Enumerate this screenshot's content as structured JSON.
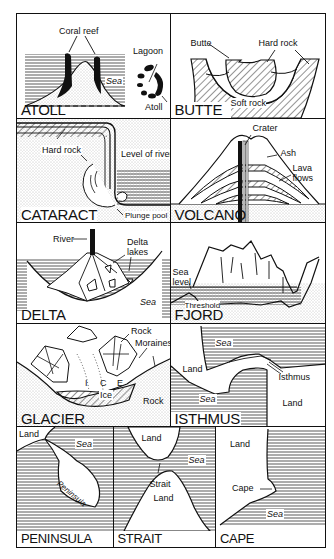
{
  "page_number": "",
  "panels": [
    {
      "id": "atoll",
      "title": "ATOLL",
      "labels": {
        "coral_reef": "Coral reef",
        "sea": "Sea",
        "lagoon": "Lagoon",
        "atoll": "Atoll"
      }
    },
    {
      "id": "butte",
      "title": "BUTTE",
      "labels": {
        "butte": "Butte",
        "hard_rock": "Hard rock",
        "soft_rock": "Soft rock"
      }
    },
    {
      "id": "cataract",
      "title": "CATARACT",
      "labels": {
        "hard_rock": "Hard rock",
        "level_of_river": "Level of river",
        "plunge_pool": "Plunge pool"
      }
    },
    {
      "id": "volcano",
      "title": "VOLCANO",
      "labels": {
        "crater": "Crater",
        "ash": "Ash",
        "lava": "Lava",
        "flows": "flows"
      }
    },
    {
      "id": "delta",
      "title": "DELTA",
      "labels": {
        "river": "River",
        "delta": "Delta",
        "lakes": "lakes",
        "sea": "Sea"
      }
    },
    {
      "id": "fjord",
      "title": "FJORD",
      "labels": {
        "sea": "Sea",
        "level": "level",
        "threshold": "Threshold"
      }
    },
    {
      "id": "glacier",
      "title": "GLACIER",
      "labels": {
        "rock_top": "Rock",
        "moraines": "Moraines",
        "i": "I",
        "c": "C",
        "e": "E",
        "ice": "Ice",
        "rock_bottom": "Rock"
      }
    },
    {
      "id": "isthmus",
      "title": "ISTHMUS",
      "labels": {
        "sea_top": "Sea",
        "land_left": "Land",
        "isthmus": "Isthmus",
        "sea_bottom": "Sea",
        "land_right": "Land"
      }
    },
    {
      "id": "peninsula",
      "title": "PENINSULA",
      "labels": {
        "land": "Land",
        "sea": "Sea",
        "peninsula": "Peninsula"
      }
    },
    {
      "id": "strait",
      "title": "STRAIT",
      "labels": {
        "land_top": "Land",
        "sea": "Sea",
        "strait": "Strait",
        "land_bottom": "Land"
      }
    },
    {
      "id": "cape",
      "title": "CAPE",
      "labels": {
        "land": "Land",
        "cape": "Cape",
        "sea": "Sea"
      }
    }
  ],
  "colors": {
    "ink": "#111111",
    "paper": "#ffffff",
    "stipple": "#9a9a9a"
  }
}
